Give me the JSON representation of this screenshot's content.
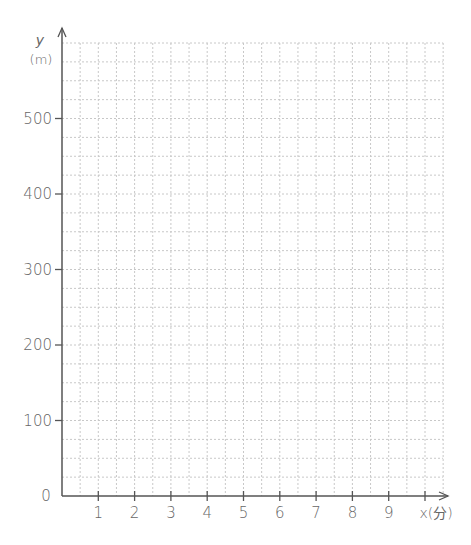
{
  "chart_data": {
    "type": "line",
    "title": "",
    "xlabel": "x(分)",
    "ylabel": "y",
    "ylabel_unit": "(m)",
    "x_ticks": [
      "1",
      "2",
      "3",
      "4",
      "5",
      "6",
      "7",
      "8",
      "9"
    ],
    "y_ticks": [
      "100",
      "200",
      "300",
      "400",
      "500"
    ],
    "origin_label": "0",
    "xlim": [
      0,
      10.5
    ],
    "ylim": [
      0,
      600
    ],
    "x_minor_step": 0.5,
    "y_minor_step": 25,
    "grid": true,
    "series": []
  },
  "colors": {
    "axis": "#555555",
    "grid": "#c8c8c8",
    "text": "#666666"
  }
}
